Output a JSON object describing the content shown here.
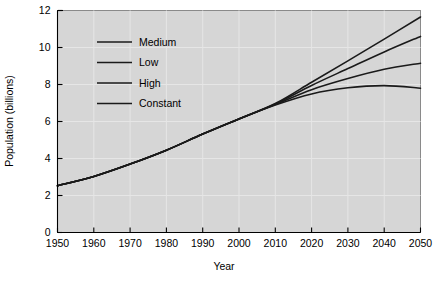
{
  "chart_data": {
    "type": "line",
    "title": "",
    "xlabel": "Year",
    "ylabel": "Population (billions)",
    "xlim": [
      1950,
      2050
    ],
    "ylim": [
      0,
      12
    ],
    "grid": true,
    "legend_position": "upper-left-inside",
    "xticks": [
      1950,
      1960,
      1970,
      1980,
      1990,
      2000,
      2010,
      2020,
      2030,
      2040,
      2050
    ],
    "yticks": [
      0,
      2,
      4,
      6,
      8,
      10,
      12
    ],
    "x": [
      1950,
      1960,
      1970,
      1980,
      1990,
      2000,
      2010,
      2020,
      2030,
      2040,
      2050
    ],
    "series": [
      {
        "name": "Medium",
        "values": [
          2.53,
          3.03,
          3.7,
          4.45,
          5.32,
          6.14,
          6.92,
          7.72,
          8.32,
          8.82,
          9.15
        ]
      },
      {
        "name": "Low",
        "values": [
          2.53,
          3.03,
          3.7,
          4.45,
          5.32,
          6.14,
          6.89,
          7.49,
          7.82,
          7.94,
          7.8
        ]
      },
      {
        "name": "High",
        "values": [
          2.53,
          3.03,
          3.7,
          4.45,
          5.32,
          6.14,
          6.95,
          7.95,
          8.86,
          9.76,
          10.6
        ]
      },
      {
        "name": "Constant",
        "values": [
          2.53,
          3.03,
          3.7,
          4.45,
          5.32,
          6.14,
          6.97,
          8.12,
          9.28,
          10.45,
          11.65
        ]
      }
    ]
  },
  "legend": {
    "items": [
      {
        "label": "Medium"
      },
      {
        "label": "Low"
      },
      {
        "label": "High"
      },
      {
        "label": "Constant"
      }
    ]
  },
  "colors": {
    "plot_background": "#d6d6d6",
    "page_background": "#ffffff",
    "gridline": "#e6e6e6",
    "curve": "#1a1a1a",
    "axis": "#000000"
  }
}
